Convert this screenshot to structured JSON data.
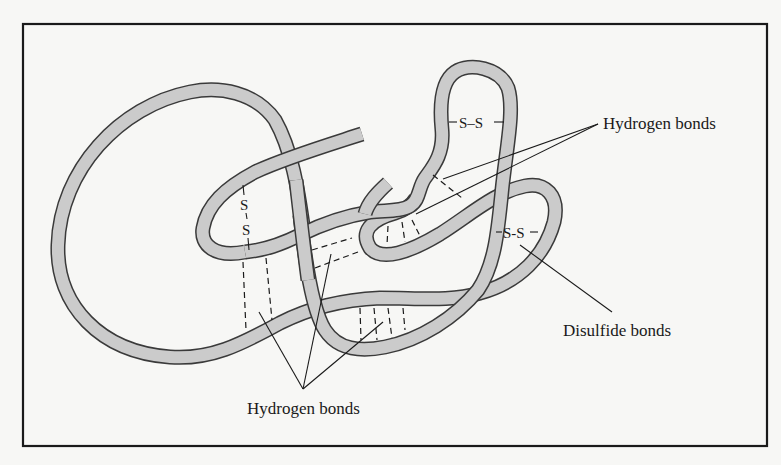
{
  "figure": {
    "colors": {
      "background": "#f7f7f5",
      "ribbon_fill": "#cbcbcb",
      "ribbon_outline": "#3a3a3a",
      "ink": "#1a1a1a"
    },
    "labels": {
      "hydrogen_top_right": "Hydrogen bonds",
      "hydrogen_bottom": "Hydrogen bonds",
      "disulfide": "Disulfide bonds"
    },
    "disulfide_bonds": {
      "left_upper_s": "S",
      "left_lower_s": "S",
      "top": "S–S",
      "right": "S-S"
    }
  }
}
